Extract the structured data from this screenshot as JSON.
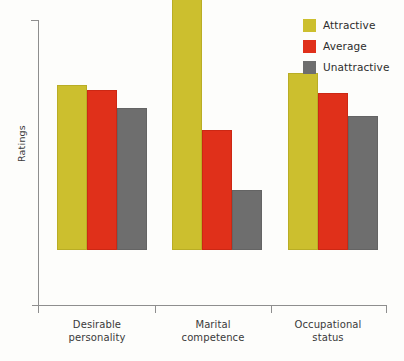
{
  "chart_data": {
    "type": "bar",
    "title": "",
    "subtitle": "",
    "xlabel": "",
    "ylabel": "Ratings",
    "categories": [
      "Desirable personality",
      "Marital competence",
      "Occupational status"
    ],
    "category_lines": [
      [
        "Desirable",
        "personality"
      ],
      [
        "Marital",
        "competence"
      ],
      [
        "Occupational",
        "status"
      ]
    ],
    "series": [
      {
        "name": "Attractive",
        "color": "#ccbf2e",
        "values": [
          58,
          100,
          62
        ]
      },
      {
        "name": "Average",
        "color": "#e0301a",
        "values": [
          56,
          42,
          55
        ]
      },
      {
        "name": "Unattractive",
        "color": "#6e6e6e",
        "values": [
          50,
          21,
          47
        ]
      }
    ],
    "ylim": [
      0,
      100
    ],
    "y_tick_labels": [],
    "grid": false,
    "legend_position": "top-right"
  },
  "legend": {
    "items": [
      {
        "label": "Attractive",
        "color": "#ccbf2e"
      },
      {
        "label": "Average",
        "color": "#e0301a"
      },
      {
        "label": "Unattractive",
        "color": "#6e6e6e"
      }
    ]
  },
  "axes": {
    "y_title": "Ratings"
  }
}
